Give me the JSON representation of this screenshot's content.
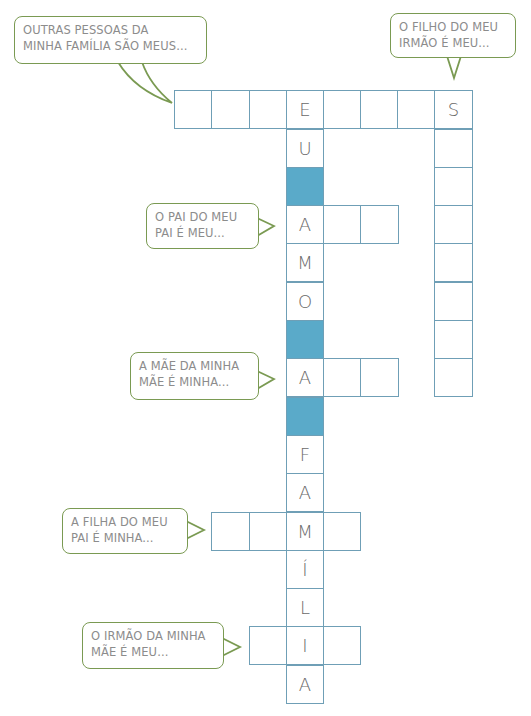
{
  "puzzle": {
    "type": "crossword",
    "hidden_phrase": "EU AMO A FAMÍLIA",
    "colors": {
      "grid_border": "#6f9fb6",
      "shaded_cell": "#5aaac9",
      "bubble_border": "#7a9a52",
      "bubble_text": "#8c8c8c",
      "letter": "#6a6a6a"
    },
    "clues": [
      {
        "id": "outros",
        "lines": [
          "OUTRAS PESSOAS DA",
          "MINHA FAMÍLIA SÃO MEUS..."
        ]
      },
      {
        "id": "sobrinho",
        "lines": [
          "O FILHO DO MEU",
          "IRMÃO É MEU..."
        ]
      },
      {
        "id": "avo",
        "lines": [
          "O PAI DO MEU",
          "PAI É MEU..."
        ]
      },
      {
        "id": "avo-f",
        "lines": [
          "A MÃE DA MINHA",
          "MÃE É MINHA..."
        ]
      },
      {
        "id": "irma",
        "lines": [
          "A FILHA DO MEU",
          "PAI É MINHA..."
        ]
      },
      {
        "id": "tio",
        "lines": [
          "O IRMÃO DA MINHA",
          "MÃE É MEU..."
        ]
      }
    ],
    "grid_letters": {
      "top_row": [
        "",
        "",
        "",
        "E",
        "",
        "",
        "",
        "S"
      ],
      "vertical_main": [
        "E",
        "U",
        "",
        "A",
        "M",
        "O",
        "",
        "A",
        "",
        "F",
        "A",
        "M",
        "Í",
        "L",
        "I",
        "A"
      ],
      "vertical_right": [
        "S",
        "",
        "",
        "",
        "",
        "",
        "",
        ""
      ]
    }
  }
}
